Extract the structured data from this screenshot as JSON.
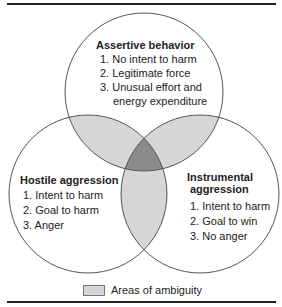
{
  "colors": {
    "ambiguity_fill": "#d6d6d6",
    "triple_overlap_fill": "#8c8c8c",
    "stroke": "#555555",
    "rule": "#222222"
  },
  "circles": {
    "assertive": {
      "title": "Assertive behavior",
      "items": [
        "1. No intent to harm",
        "2. Legitimate force",
        "3. Unusual effort and",
        "energy expenditure"
      ]
    },
    "hostile": {
      "title": "Hostile aggression",
      "items": [
        "1. Intent to harm",
        "2. Goal to harm",
        "3. Anger"
      ]
    },
    "instrumental": {
      "title_line1": "Instrumental",
      "title_line2": "aggression",
      "items": [
        "1. Intent to harm",
        "2. Goal to win",
        "3. No anger"
      ]
    }
  },
  "legend": {
    "label": "Areas of ambiguity"
  }
}
